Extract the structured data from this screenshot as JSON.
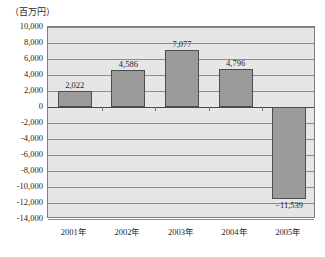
{
  "chart_data": {
    "type": "bar",
    "title": "",
    "subtitle": "",
    "unit_caption": "（百万円）",
    "xlabel": "",
    "ylabel": "",
    "categories": [
      "2001年",
      "2002年",
      "2003年",
      "2004年",
      "2005年"
    ],
    "values": [
      2022,
      4586,
      7077,
      4796,
      -11539
    ],
    "value_labels": [
      "2,022",
      "4,586",
      "7,077",
      "4,796",
      "−11,539"
    ],
    "ylim": [
      -14000,
      10000
    ],
    "ytick_values": [
      10000,
      8000,
      6000,
      4000,
      2000,
      0,
      -2000,
      -4000,
      -6000,
      -8000,
      -10000,
      -12000,
      -14000
    ],
    "ytick_labels": [
      "10,000",
      "8,000",
      "6,000",
      "4,000",
      "2,000",
      "0",
      "-2,000",
      "-4,000",
      "-6,000",
      "-8,000",
      "-10,000",
      "-12,000",
      "-14,000"
    ],
    "grid": true,
    "legend": "none",
    "series": [
      {
        "name": "",
        "values": [
          2022,
          4586,
          7077,
          4796,
          -11539
        ]
      }
    ],
    "colors": {
      "bar_fill": "#9b9b9b",
      "bar_border": "#4d4d4d",
      "plot_background": "#e6e6e6",
      "gridline": "#8c8c8c",
      "zero_line": "#4a4a4a",
      "plot_border": "#7d7d7d",
      "text": "#1f1f1f"
    }
  }
}
